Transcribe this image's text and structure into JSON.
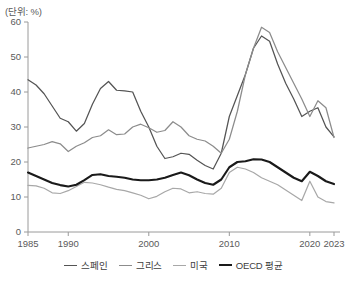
{
  "unit_label": "(단위: %)",
  "legend": {
    "position": "bottom",
    "items": [
      {
        "label": "스페인",
        "color": "#545454",
        "width": 1.5
      },
      {
        "label": "그리스",
        "color": "#8c8c8c",
        "width": 1.3
      },
      {
        "label": "미국",
        "color": "#a8a8a8",
        "width": 1.3
      },
      {
        "label": "OECD 평균",
        "color": "#1a1a1a",
        "width": 2.2
      }
    ]
  },
  "axes": {
    "y_ticks": [
      "0",
      "10",
      "20",
      "30",
      "40",
      "50",
      "60"
    ],
    "x_ticks": [
      "1985",
      "1990",
      "2000",
      "2010",
      "2020",
      "2023"
    ]
  },
  "chart_data": {
    "type": "line",
    "title": "",
    "subtitle": "",
    "xlabel": "",
    "ylabel": "",
    "unit": "%",
    "xlim": [
      1985,
      2023
    ],
    "ylim": [
      0,
      60
    ],
    "ytick_values": [
      0,
      10,
      20,
      30,
      40,
      50,
      60
    ],
    "xtick_values": [
      1985,
      1990,
      2000,
      2010,
      2020,
      2023
    ],
    "grid": false,
    "legend_position": "bottom",
    "x": [
      1985,
      1986,
      1987,
      1988,
      1989,
      1990,
      1991,
      1992,
      1993,
      1994,
      1995,
      1996,
      1997,
      1998,
      1999,
      2000,
      2001,
      2002,
      2003,
      2004,
      2005,
      2006,
      2007,
      2008,
      2009,
      2010,
      2011,
      2012,
      2013,
      2014,
      2015,
      2016,
      2017,
      2018,
      2019,
      2020,
      2021,
      2022,
      2023
    ],
    "series": [
      {
        "name": "스페인",
        "color": "#545454",
        "values": [
          43.5,
          42.0,
          39.5,
          36.0,
          32.5,
          31.5,
          28.8,
          31.0,
          36.5,
          41.0,
          43.0,
          40.5,
          40.3,
          40.0,
          34.5,
          30.0,
          24.5,
          21.0,
          21.5,
          22.5,
          22.2,
          20.5,
          19.0,
          18.0,
          22.5,
          33.0,
          39.0,
          45.0,
          52.5,
          56.0,
          54.5,
          48.0,
          42.5,
          38.0,
          33.0,
          34.5,
          35.5,
          30.0,
          27.2
        ]
      },
      {
        "name": "그리스",
        "color": "#8c8c8c",
        "values": [
          24.0,
          24.5,
          25.0,
          25.8,
          25.2,
          23.0,
          24.5,
          25.5,
          27.0,
          27.5,
          29.2,
          27.8,
          28.0,
          30.0,
          30.8,
          29.8,
          28.5,
          29.0,
          31.5,
          30.0,
          27.5,
          26.5,
          26.0,
          24.5,
          22.5,
          26.5,
          34.5,
          45.0,
          52.5,
          58.5,
          57.0,
          51.5,
          47.0,
          42.5,
          38.0,
          33.0,
          37.5,
          35.5,
          27.0
        ]
      },
      {
        "name": "미국",
        "color": "#a8a8a8",
        "values": [
          13.3,
          13.2,
          12.5,
          11.2,
          11.0,
          11.8,
          13.0,
          14.2,
          14.0,
          13.5,
          12.8,
          12.2,
          11.8,
          11.2,
          10.5,
          9.5,
          10.2,
          11.5,
          12.5,
          12.3,
          11.2,
          11.5,
          11.0,
          10.8,
          12.5,
          17.0,
          18.5,
          18.0,
          17.0,
          15.5,
          14.5,
          13.5,
          12.0,
          10.5,
          9.0,
          14.5,
          10.0,
          8.7,
          8.3
        ]
      },
      {
        "name": "OECD 평균",
        "color": "#1a1a1a",
        "values": [
          17.0,
          16.0,
          15.0,
          14.0,
          13.4,
          13.0,
          13.5,
          14.8,
          16.3,
          16.5,
          16.0,
          15.8,
          15.5,
          15.0,
          14.8,
          14.8,
          15.0,
          15.5,
          16.3,
          17.0,
          16.2,
          15.0,
          14.0,
          13.5,
          15.0,
          18.5,
          20.0,
          20.2,
          20.8,
          20.7,
          20.0,
          18.5,
          17.0,
          15.5,
          14.5,
          17.2,
          16.0,
          14.5,
          13.7
        ]
      }
    ]
  }
}
